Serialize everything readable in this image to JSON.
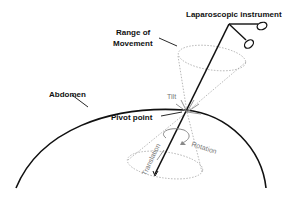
{
  "labels": {
    "instrument": "Laparoscopic instrument",
    "range_line1": "Range of",
    "range_line2": "Movement",
    "abdomen": "Abdomen",
    "pivot": "Pivot point",
    "tilt": "Tilt",
    "rotation": "Rotation",
    "translation": "Translation"
  },
  "colors": {
    "ink": "#111111",
    "gray": "#888888",
    "dotted": "#999999"
  }
}
